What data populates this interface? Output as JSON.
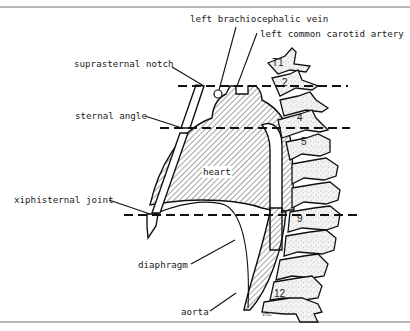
{
  "figure": {
    "type": "anatomical-diagram",
    "labels": {
      "left_brachiocephalic_vein": "left brachiocephalic vein",
      "left_common_carotid_artery": "left common carotid artery",
      "suprasternal_notch": "suprasternal notch",
      "sternal_angle": "sternal angle",
      "heart": "heart",
      "xiphisternal_joint": "xiphisternal joint",
      "diaphragm": "diaphragm",
      "aorta": "aorta"
    },
    "vertebra_labels": {
      "t1": "T1",
      "t2": "2",
      "t4": "4",
      "t5": "5",
      "t9": "9",
      "t12": "12"
    },
    "signature": "VHC",
    "level_lines": [
      {
        "landmark": "suprasternal notch",
        "vertebral_level": "T2"
      },
      {
        "landmark": "sternal angle",
        "vertebral_level": "T4/T5"
      },
      {
        "landmark": "xiphisternal joint",
        "vertebral_level": "T9"
      }
    ],
    "colors": {
      "line": "#111111",
      "frame": "#777777",
      "background": "#ffffff",
      "stipple": "#888888"
    }
  }
}
